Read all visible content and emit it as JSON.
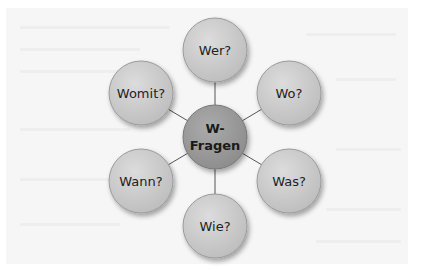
{
  "diagram": {
    "type": "mind-map",
    "center": {
      "label_line1": "W-",
      "label_line2": "Fragen"
    },
    "nodes": [
      {
        "id": "wer",
        "label": "Wer?"
      },
      {
        "id": "wo",
        "label": "Wo?"
      },
      {
        "id": "was",
        "label": "Was?"
      },
      {
        "id": "wie",
        "label": "Wie?"
      },
      {
        "id": "wann",
        "label": "Wann?"
      },
      {
        "id": "womit",
        "label": "Womit?"
      }
    ],
    "colors": {
      "node_fill": "#cfcfcf",
      "center_fill": "#9e9e9e",
      "connector": "#555555",
      "background": "#f6f6f6"
    }
  }
}
